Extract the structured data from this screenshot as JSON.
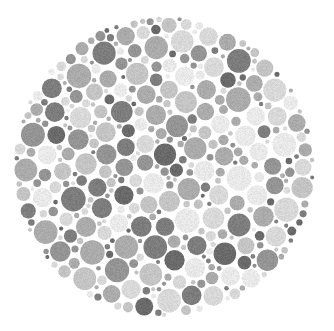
{
  "image": {
    "kind": "ishihara-color-vision-test-plate",
    "title": "Ishihara Pseudoisochromatic Plate",
    "rendering": "grayscale",
    "width": 334,
    "height": 331,
    "background_color": "#ffffff",
    "hidden_figure_visible": false,
    "hidden_figure_note": "No numeral is discernible; the plate is reproduced in grayscale so the chromatic figure is not resolvable."
  },
  "plate": {
    "shape": "circle",
    "center_x": 164,
    "center_y": 167,
    "radius": 151,
    "dot_count": 1150,
    "dot_radius_min": 2.0,
    "dot_radius_max": 12.6,
    "dot_gap": 0.85,
    "grain_strength": 9
  },
  "palette": {
    "name": "grayscale-dot-tones",
    "tones": [
      {
        "label": "lightest",
        "color": "#e9e9e9",
        "weight": 13
      },
      {
        "label": "light",
        "color": "#d8d8d8",
        "weight": 15
      },
      {
        "label": "light-mid",
        "color": "#c4c4c4",
        "weight": 16
      },
      {
        "label": "mid",
        "color": "#ababab",
        "weight": 18
      },
      {
        "label": "mid-dark",
        "color": "#949494",
        "weight": 16
      },
      {
        "label": "dark",
        "color": "#7d7d7d",
        "weight": 13
      },
      {
        "label": "darkest",
        "color": "#6a6a6a",
        "weight": 9
      }
    ]
  },
  "chart_data": {
    "type": "scatter",
    "xlabel": "",
    "ylabel": "",
    "xlim": [
      0,
      334
    ],
    "ylim": [
      0,
      331
    ],
    "grid": false,
    "legend": "none",
    "marker": "filled-circle",
    "series": [
      {
        "name": "lightest",
        "color": "#e9e9e9",
        "share_pct": 13
      },
      {
        "name": "light",
        "color": "#d8d8d8",
        "share_pct": 15
      },
      {
        "name": "light-mid",
        "color": "#c4c4c4",
        "share_pct": 16
      },
      {
        "name": "mid",
        "color": "#ababab",
        "share_pct": 18
      },
      {
        "name": "mid-dark",
        "color": "#949494",
        "share_pct": 16
      },
      {
        "name": "dark",
        "color": "#7d7d7d",
        "share_pct": 13
      },
      {
        "name": "darkest",
        "color": "#6a6a6a",
        "share_pct": 9
      }
    ],
    "annotations": [
      "Dots are packed without overlap inside a single circular boundary.",
      "Dot radii vary continuously between the stated minimum and maximum."
    ]
  }
}
